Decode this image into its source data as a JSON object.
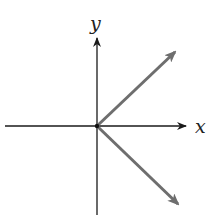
{
  "diagram": {
    "title": "",
    "axes": {
      "x_label": "x",
      "y_label": "y",
      "origin": [
        97,
        126
      ],
      "axis_color": "#1a1a1a"
    },
    "vectors": [
      {
        "name": "upper-vector",
        "from": [
          97,
          126
        ],
        "to": [
          175,
          52
        ],
        "color": "#6e6e6e"
      },
      {
        "name": "lower-vector",
        "from": [
          97,
          126
        ],
        "to": [
          178,
          204
        ],
        "color": "#6e6e6e"
      }
    ]
  }
}
